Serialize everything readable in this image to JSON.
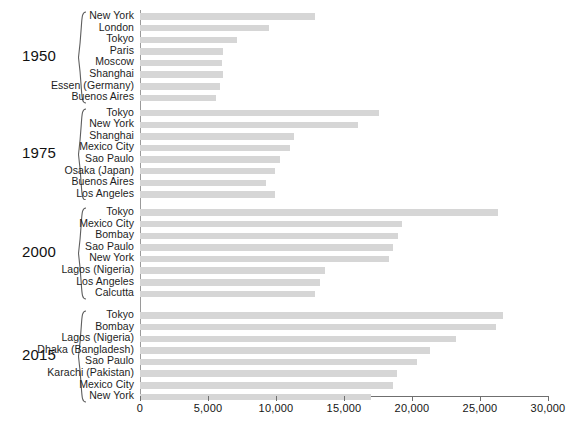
{
  "chart_data": {
    "type": "bar",
    "orientation": "horizontal",
    "title": "",
    "subtitle": "",
    "xlabel": "",
    "ylabel": "",
    "xlim": [
      0,
      30000
    ],
    "grid": false,
    "legend": null,
    "xticks": [
      0,
      5000,
      10000,
      15000,
      20000,
      25000,
      30000
    ],
    "xtick_labels": [
      "0",
      "5,000",
      "10,000",
      "15,000",
      "20,000",
      "25,000",
      "30,000"
    ],
    "groups": [
      {
        "label": "1950",
        "categories": [
          "New York",
          "London",
          "Tokyo",
          "Paris",
          "Moscow",
          "Shanghai",
          "Essen (Germany)",
          "Buenos Aires"
        ],
        "values": [
          12900,
          9500,
          7100,
          6100,
          6000,
          6100,
          5900,
          5600
        ]
      },
      {
        "label": "1975",
        "categories": [
          "Tokyo",
          "New York",
          "Shanghai",
          "Mexico City",
          "Sao Paulo",
          "Osaka (Japan)",
          "Buenos Aires",
          "Los Angeles"
        ],
        "values": [
          17600,
          16000,
          11300,
          11000,
          10300,
          9900,
          9300,
          9900
        ]
      },
      {
        "label": "2000",
        "categories": [
          "Tokyo",
          "Mexico City",
          "Bombay",
          "Sao Paulo",
          "New York",
          "Lagos (Nigeria)",
          "Los Angeles",
          "Calcutta"
        ],
        "values": [
          26300,
          19300,
          19000,
          18600,
          18300,
          13600,
          13200,
          12900
        ]
      },
      {
        "label": "2015",
        "categories": [
          "Tokyo",
          "Bombay",
          "Lagos (Nigeria)",
          "Dhaka (Bangladesh)",
          "Sao Paulo",
          "Karachi (Pakistan)",
          "Mexico City",
          "New York"
        ],
        "values": [
          26700,
          26200,
          23200,
          21300,
          20400,
          18900,
          18600,
          17000
        ]
      }
    ]
  },
  "colors": {
    "bar": "#d6d6d6",
    "axis": "#6f6f6f",
    "text": "#1a1a1a",
    "background": "#ffffff"
  }
}
